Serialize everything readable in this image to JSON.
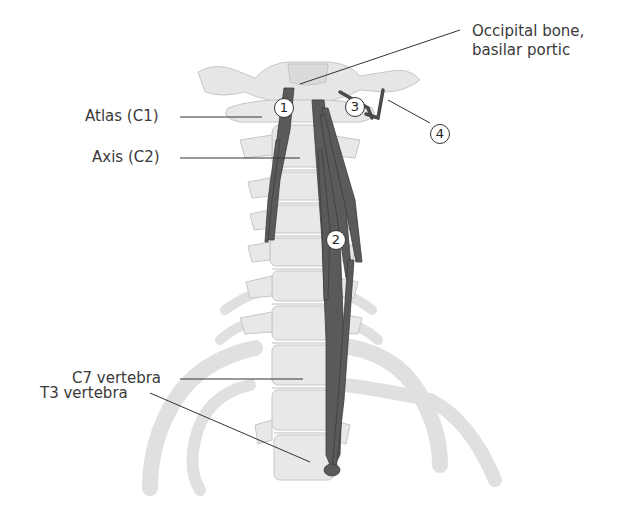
{
  "figure": {
    "colors": {
      "bone": "#e6e6e6",
      "bone_edge": "#c8c8c8",
      "bone_shadow": "#d2d2d2",
      "muscle": "#5a5a5a",
      "muscle_edge": "#3e3e3e",
      "leader": "#333333",
      "text": "#3a3a3a"
    },
    "labels": {
      "occipital": "Occipital bone,",
      "occipital_2": "basilar portic",
      "atlas": "Atlas (C1)",
      "axis": "Axis (C2)",
      "c7": "C7 vertebra",
      "t3": "T3 vertebra"
    },
    "callouts": [
      "1",
      "2",
      "3",
      "4"
    ]
  }
}
